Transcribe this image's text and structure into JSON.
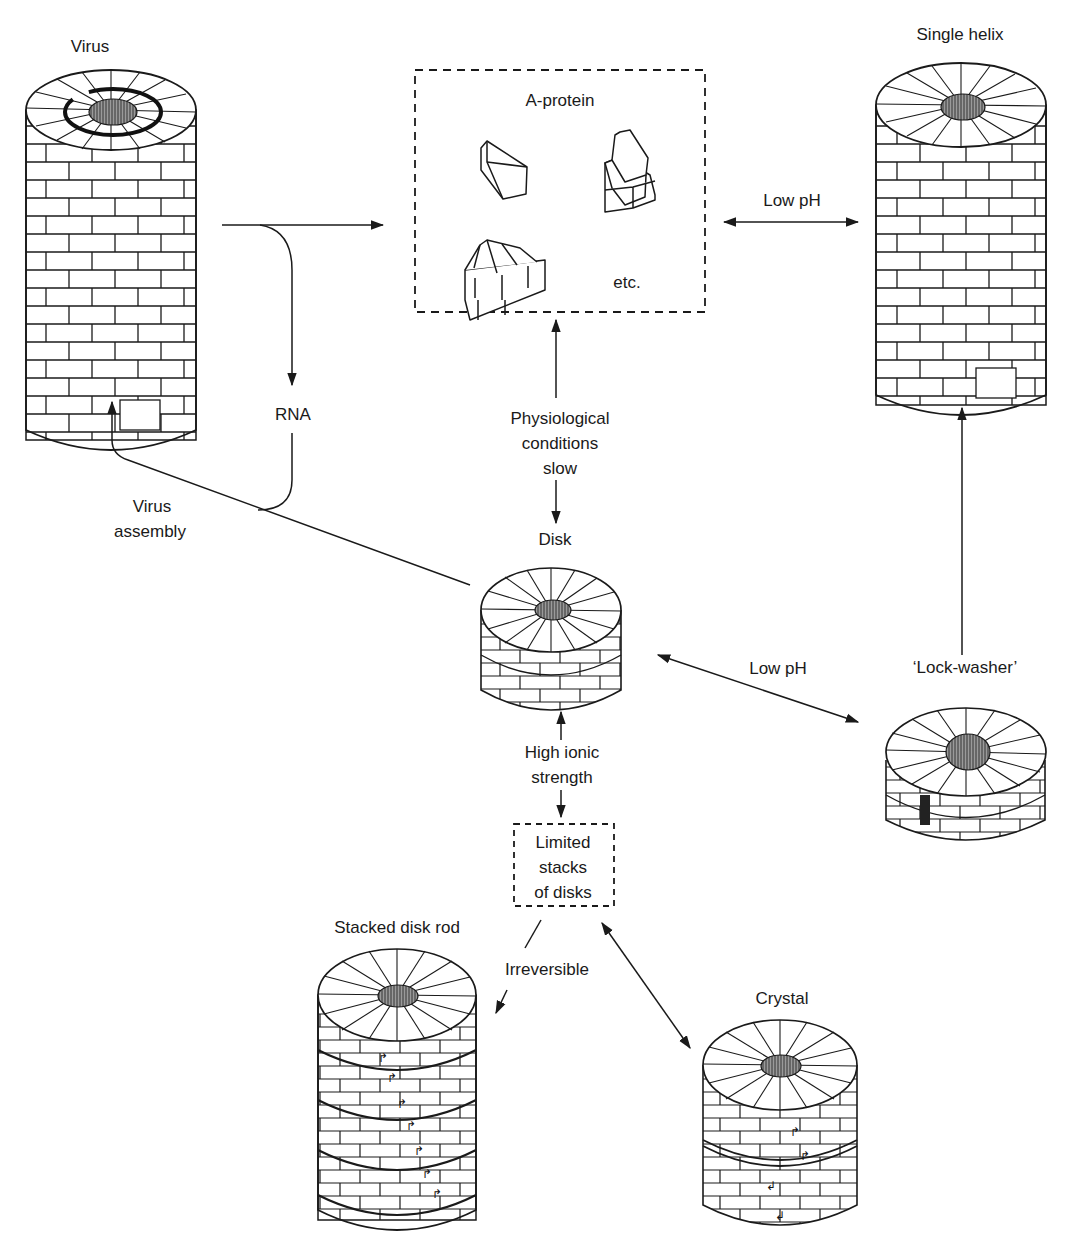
{
  "diagram": {
    "nodes": {
      "virus": {
        "label": "Virus"
      },
      "a_protein": {
        "label": "A-protein",
        "etc": "etc."
      },
      "single_helix": {
        "label": "Single helix"
      },
      "disk": {
        "label": "Disk"
      },
      "lock_washer": {
        "label": "‘Lock-washer’"
      },
      "limited_stacks": {
        "line1": "Limited",
        "line2": "stacks",
        "line3": "of disks"
      },
      "stacked_disk_rod": {
        "label": "Stacked disk rod"
      },
      "crystal": {
        "label": "Crystal"
      }
    },
    "edges": {
      "virus_to_aprotein": {
        "label": ""
      },
      "rna": {
        "label": "RNA"
      },
      "aprotein_helix": {
        "label": "Low pH"
      },
      "physiological": {
        "line1": "Physiological",
        "line2": "conditions",
        "line3": "slow"
      },
      "virus_assembly": {
        "line1": "Virus",
        "line2": "assembly"
      },
      "disk_lockwasher": {
        "label": "Low pH"
      },
      "ionic": {
        "line1": "High ionic",
        "line2": "strength"
      },
      "irreversible": {
        "label": "Irreversible"
      }
    },
    "colors": {
      "ink": "#1a1a1a",
      "background": "#ffffff",
      "core_shade": "#555555"
    }
  }
}
